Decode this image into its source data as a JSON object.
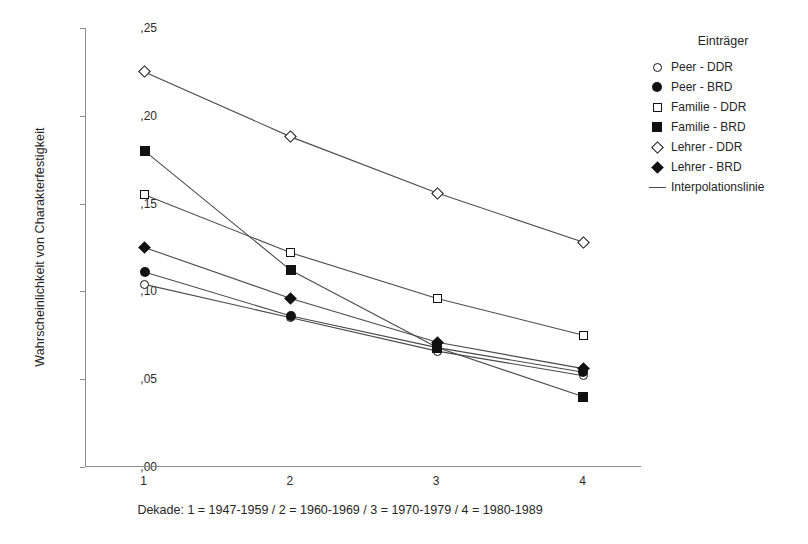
{
  "chart_data": {
    "type": "line",
    "title": "",
    "xlabel": "Dekade: 1 = 1947-1959 / 2 = 1960-1969 / 3 = 1970-1979 / 4 = 1980-1989",
    "ylabel": "Wahrscheinlichkeit von Charakterfestigkeit",
    "categories": [
      "1",
      "2",
      "3",
      "4"
    ],
    "x": [
      1,
      2,
      3,
      4
    ],
    "xlim": [
      0.6,
      4.4
    ],
    "ylim": [
      0.0,
      0.25
    ],
    "yticks": [
      0.0,
      0.05,
      0.1,
      0.15,
      0.2,
      0.25
    ],
    "ytick_labels": [
      ",00",
      ",05",
      ",10",
      ",15",
      ",20",
      ",25"
    ],
    "xtick_labels": [
      "1",
      "2",
      "3",
      "4"
    ],
    "grid": false,
    "legend_position": "right",
    "series": [
      {
        "name": "Peer - DDR",
        "marker": "circle-open",
        "values": [
          0.104,
          0.085,
          0.066,
          0.052
        ]
      },
      {
        "name": "Peer - BRD",
        "marker": "circle-fill",
        "values": [
          0.111,
          0.086,
          0.068,
          0.054
        ]
      },
      {
        "name": "Familie - DDR",
        "marker": "square-open",
        "values": [
          0.155,
          0.122,
          0.096,
          0.075
        ]
      },
      {
        "name": "Familie - BRD",
        "marker": "square-fill",
        "values": [
          0.18,
          0.112,
          0.068,
          0.04
        ]
      },
      {
        "name": "Lehrer - DDR",
        "marker": "diamond-open",
        "values": [
          0.225,
          0.188,
          0.156,
          0.128
        ]
      },
      {
        "name": "Lehrer - BRD",
        "marker": "diamond-fill",
        "values": [
          0.125,
          0.096,
          0.071,
          0.056
        ]
      }
    ]
  },
  "legend": {
    "title": "Einträger",
    "items": [
      {
        "label": "Peer - DDR",
        "marker": "circle-open"
      },
      {
        "label": "Peer - BRD",
        "marker": "circle-fill"
      },
      {
        "label": "Familie - DDR",
        "marker": "square-open"
      },
      {
        "label": "Familie - BRD",
        "marker": "square-fill"
      },
      {
        "label": "Lehrer - DDR",
        "marker": "diamond-open"
      },
      {
        "label": "Lehrer - BRD",
        "marker": "diamond-fill"
      },
      {
        "label": "Interpolationslinie",
        "marker": "line"
      }
    ]
  },
  "colors": {
    "line": "#4a4a4a",
    "marker": "#111111",
    "axis": "#8c8c8c",
    "text": "#262626",
    "background": "#ffffff"
  }
}
